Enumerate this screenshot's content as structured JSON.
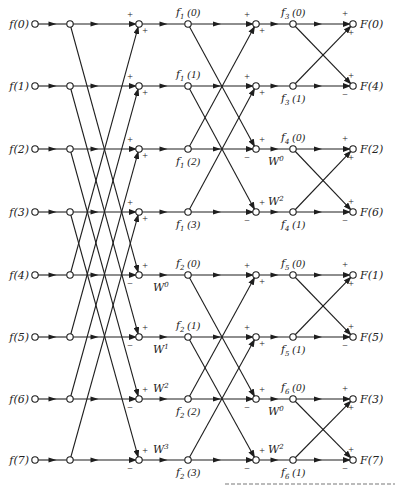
{
  "diagram": {
    "inputs": [
      "f(0)",
      "f(1)",
      "f(2)",
      "f(3)",
      "f(4)",
      "f(5)",
      "f(6)",
      "f(7)"
    ],
    "outputs": [
      "F(0)",
      "F(4)",
      "F(2)",
      "F(6)",
      "F(1)",
      "F(5)",
      "F(3)",
      "F(7)"
    ],
    "stage1_labels": [
      {
        "base": "f",
        "sub": "1",
        "arg": "(0)"
      },
      {
        "base": "f",
        "sub": "1",
        "arg": "(1)"
      },
      {
        "base": "f",
        "sub": "1",
        "arg": "(2)"
      },
      {
        "base": "f",
        "sub": "1",
        "arg": "(3)"
      },
      {
        "base": "f",
        "sub": "2",
        "arg": "(0)"
      },
      {
        "base": "f",
        "sub": "2",
        "arg": "(1)"
      },
      {
        "base": "f",
        "sub": "2",
        "arg": "(2)"
      },
      {
        "base": "f",
        "sub": "2",
        "arg": "(3)"
      }
    ],
    "stage2_labels": [
      {
        "base": "f",
        "sub": "3",
        "arg": "(0)"
      },
      {
        "base": "f",
        "sub": "3",
        "arg": "(1)"
      },
      {
        "base": "f",
        "sub": "4",
        "arg": "(0)"
      },
      {
        "base": "f",
        "sub": "4",
        "arg": "(1)"
      },
      {
        "base": "f",
        "sub": "5",
        "arg": "(0)"
      },
      {
        "base": "f",
        "sub": "5",
        "arg": "(1)"
      },
      {
        "base": "f",
        "sub": "6",
        "arg": "(0)"
      },
      {
        "base": "f",
        "sub": "6",
        "arg": "(1)"
      }
    ],
    "stage1_twiddles": [
      {
        "row": 4,
        "base": "W",
        "exp": "0"
      },
      {
        "row": 5,
        "base": "W",
        "exp": "1"
      },
      {
        "row": 6,
        "base": "W",
        "exp": "2"
      },
      {
        "row": 7,
        "base": "W",
        "exp": "3"
      }
    ],
    "stage2_twiddles": [
      {
        "row": 2,
        "base": "W",
        "exp": "0"
      },
      {
        "row": 3,
        "base": "W",
        "exp": "2"
      },
      {
        "row": 6,
        "base": "W",
        "exp": "0"
      },
      {
        "row": 7,
        "base": "W",
        "exp": "2"
      }
    ],
    "signs": {
      "plus": "+",
      "minus": "−"
    }
  }
}
